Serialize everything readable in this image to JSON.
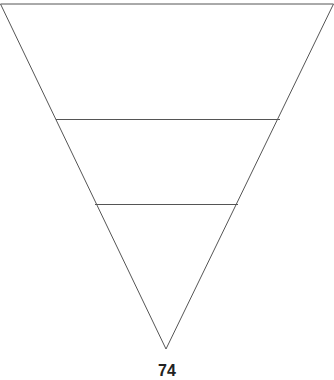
{
  "diagram": {
    "type": "inverted-pyramid",
    "stroke_color": "#555555",
    "levels": 3,
    "caption": "74"
  }
}
